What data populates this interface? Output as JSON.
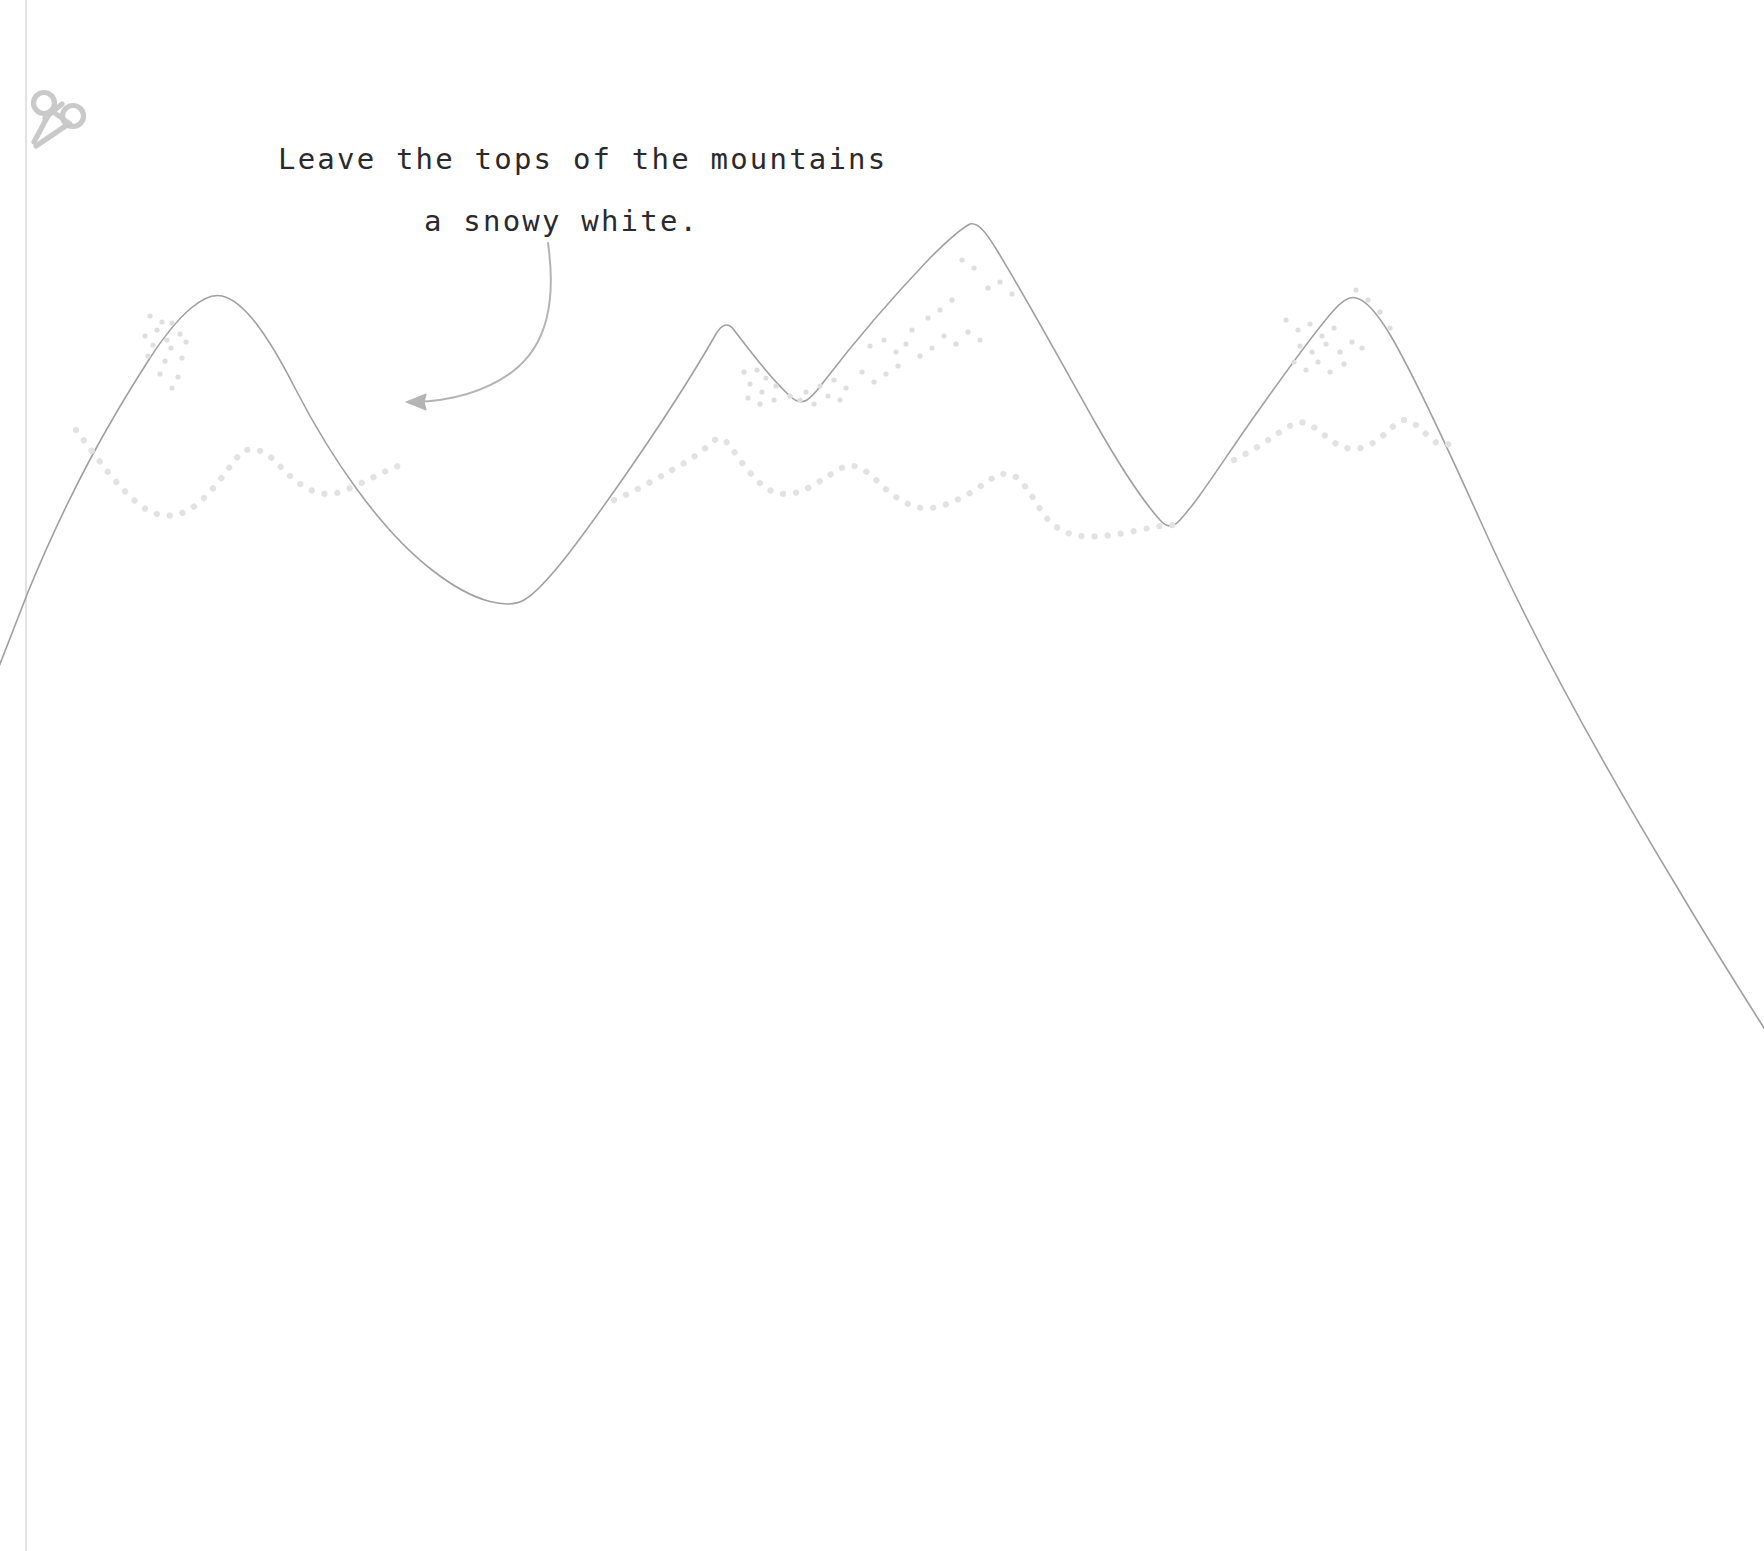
{
  "page": {
    "background_color": "#ffffff",
    "width": 1764,
    "height": 1551,
    "kind": "coloring-page-worksheet"
  },
  "cut_guide": {
    "icon_name": "scissors-icon",
    "icon_color": "#c9c9c9",
    "line_color": "#d6d6d6",
    "line_style": "solid-thin-vertical",
    "line_x": 26,
    "line_top": 0,
    "line_bottom": 1551
  },
  "annotation": {
    "lines": [
      "Leave the tops of the mountains",
      "a snowy white."
    ],
    "text_color": "#2a2a2e",
    "arrow": {
      "name": "curved-arrow",
      "color": "#b4b4b4",
      "direction": "left",
      "start": [
        548,
        245
      ],
      "end": [
        406,
        402
      ]
    }
  },
  "artwork": {
    "name": "mountain-range-outline",
    "outline_color": "#a0a0a2",
    "outline_width": 1.6,
    "snowline_color": "#e2e2e4",
    "speckle_color": "#dedee0",
    "ridge_path": "M -14,700 L 28,592 C 70,490 110,420 150,358 C 180,312 205,292 222,296 C 244,301 268,335 296,390 C 330,456 380,530 432,570 C 478,606 510,608 524,600 C 545,588 580,540 622,480 C 668,414 700,362 716,334 C 722,324 728,322 734,330 C 748,348 768,376 790,396 C 802,408 810,400 822,384 C 848,350 886,304 930,258 C 950,238 962,228 970,224 C 978,222 986,232 998,252 C 1026,298 1060,360 1096,424 C 1120,466 1142,500 1160,520 C 1166,527 1172,528 1178,522 C 1196,504 1222,462 1256,414 C 1290,366 1316,330 1334,310 C 1342,301 1350,296 1356,298 C 1366,300 1378,314 1392,338 C 1414,376 1444,440 1480,520 C 1530,632 1600,760 1680,892 C 1712,946 1740,990 1764,1028",
    "snowline_path": "M 76,430 C 96,456 116,486 140,505 C 162,522 184,518 204,498 C 222,480 232,462 242,452 C 252,446 264,450 276,462 C 296,484 318,500 340,492 C 362,484 382,472 398,466 M 614,500 C 634,492 654,480 672,470 C 690,460 702,452 712,442 C 718,436 724,438 730,446 C 740,460 752,478 766,488 C 782,498 798,494 812,486 C 826,478 836,470 846,466 C 856,464 866,470 876,480 C 890,494 906,506 922,508 C 938,510 960,500 978,488 C 992,478 1000,472 1010,474 C 1022,478 1032,496 1042,512 C 1052,526 1064,534 1080,536 C 1098,538 1120,534 1140,530 C 1158,526 1170,524 1180,526 M 1234,460 C 1250,452 1266,442 1280,432 C 1292,424 1300,420 1308,424 C 1318,428 1328,440 1340,446 C 1354,452 1368,448 1380,438 C 1390,430 1396,422 1404,420 C 1412,420 1420,428 1428,436 C 1436,444 1442,446 1450,444",
    "snowline_dot_radius": 3.1,
    "snowline_dot_gap": 13,
    "speckles": [
      [
        150,
        316
      ],
      [
        162,
        322
      ],
      [
        157,
        330
      ],
      [
        172,
        323
      ],
      [
        145,
        336
      ],
      [
        167,
        340
      ],
      [
        180,
        334
      ],
      [
        153,
        345
      ],
      [
        171,
        348
      ],
      [
        186,
        342
      ],
      [
        148,
        356
      ],
      [
        165,
        361
      ],
      [
        182,
        358
      ],
      [
        160,
        374
      ],
      [
        178,
        377
      ],
      [
        172,
        388
      ],
      [
        744,
        372
      ],
      [
        757,
        370
      ],
      [
        766,
        378
      ],
      [
        750,
        384
      ],
      [
        762,
        392
      ],
      [
        776,
        386
      ],
      [
        748,
        398
      ],
      [
        760,
        404
      ],
      [
        774,
        400
      ],
      [
        790,
        396
      ],
      [
        806,
        392
      ],
      [
        820,
        386
      ],
      [
        834,
        380
      ],
      [
        846,
        388
      ],
      [
        828,
        396
      ],
      [
        840,
        400
      ],
      [
        814,
        404
      ],
      [
        800,
        400
      ],
      [
        870,
        346
      ],
      [
        884,
        340
      ],
      [
        896,
        352
      ],
      [
        906,
        344
      ],
      [
        920,
        356
      ],
      [
        932,
        348
      ],
      [
        944,
        336
      ],
      [
        956,
        344
      ],
      [
        968,
        332
      ],
      [
        980,
        340
      ],
      [
        962,
        260
      ],
      [
        974,
        268
      ],
      [
        988,
        288
      ],
      [
        1000,
        282
      ],
      [
        1012,
        294
      ],
      [
        952,
        300
      ],
      [
        940,
        310
      ],
      [
        928,
        318
      ],
      [
        912,
        330
      ],
      [
        898,
        366
      ],
      [
        886,
        374
      ],
      [
        874,
        382
      ],
      [
        862,
        372
      ],
      [
        1286,
        320
      ],
      [
        1298,
        330
      ],
      [
        1310,
        324
      ],
      [
        1322,
        336
      ],
      [
        1334,
        328
      ],
      [
        1300,
        346
      ],
      [
        1312,
        352
      ],
      [
        1326,
        344
      ],
      [
        1340,
        352
      ],
      [
        1352,
        342
      ],
      [
        1294,
        362
      ],
      [
        1306,
        370
      ],
      [
        1318,
        362
      ],
      [
        1330,
        372
      ],
      [
        1344,
        364
      ],
      [
        1368,
        300
      ],
      [
        1380,
        312
      ],
      [
        1356,
        290
      ],
      [
        1390,
        328
      ],
      [
        1362,
        348
      ]
    ]
  }
}
